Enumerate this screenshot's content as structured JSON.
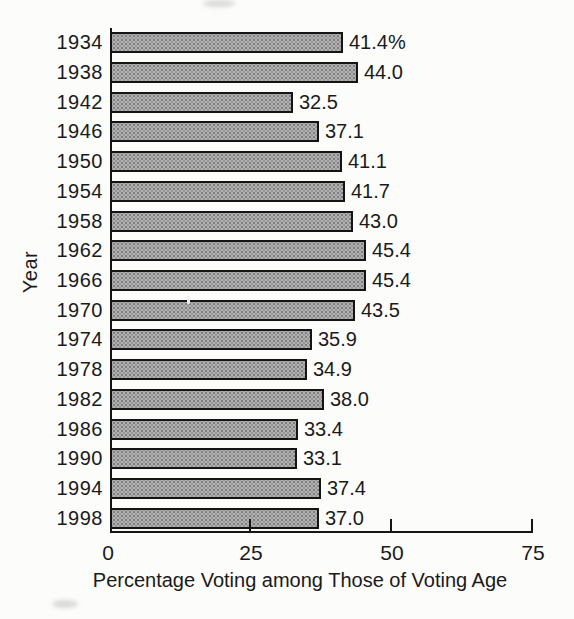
{
  "chart_data": {
    "type": "bar",
    "orientation": "horizontal",
    "title": "",
    "xlabel": "Percentage Voting among Those of Voting Age",
    "ylabel": "Year",
    "categories": [
      "1934",
      "1938",
      "1942",
      "1946",
      "1950",
      "1954",
      "1958",
      "1962",
      "1966",
      "1970",
      "1974",
      "1978",
      "1982",
      "1986",
      "1990",
      "1994",
      "1998"
    ],
    "values": [
      41.4,
      44.0,
      32.5,
      37.1,
      41.1,
      41.7,
      43.0,
      45.4,
      45.4,
      43.5,
      35.9,
      34.9,
      38.0,
      33.4,
      33.1,
      37.4,
      37.0
    ],
    "value_labels": [
      "41.4%",
      "44.0",
      "32.5",
      "37.1",
      "41.1",
      "41.7",
      "43.0",
      "45.4",
      "45.4",
      "43.5",
      "35.9",
      "34.9",
      "38.0",
      "33.4",
      "33.1",
      "37.4",
      "37.0"
    ],
    "xlim": [
      0,
      75
    ],
    "xticks": [
      0,
      25,
      50,
      75
    ],
    "xtick_labels": [
      "0",
      "25",
      "50",
      "75"
    ],
    "grid": false,
    "legend": false
  },
  "colors": {
    "bar_fill": "#b1b1b1",
    "bar_border": "#141414",
    "axis": "#151515",
    "text": "#1a1a1a",
    "background": "#fcfcfb"
  }
}
